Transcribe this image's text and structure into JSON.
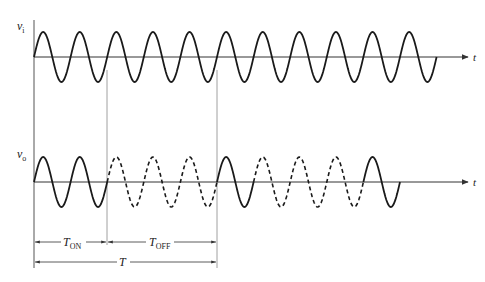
{
  "diagram": {
    "top_signal": {
      "label": "v",
      "subscript": "i",
      "axis_label": "t",
      "cycles_total": 11,
      "line_style": "solid"
    },
    "bottom_signal": {
      "label": "v",
      "subscript": "o",
      "axis_label": "t",
      "segments": [
        {
          "name": "on",
          "cycles": 2,
          "line_style": "solid"
        },
        {
          "name": "off",
          "cycles": 3,
          "line_style": "dashed"
        },
        {
          "name": "on",
          "cycles": 1,
          "line_style": "solid"
        },
        {
          "name": "off",
          "cycles": 3,
          "line_style": "dashed"
        },
        {
          "name": "on",
          "cycles": 1,
          "line_style": "solid"
        }
      ]
    },
    "intervals": {
      "t_on": {
        "label": "T",
        "subscript": "ON",
        "cycles": 2
      },
      "t_off": {
        "label": "T",
        "subscript": "OFF",
        "cycles": 3
      },
      "period": {
        "label": "T",
        "cycles": 5
      }
    },
    "colors": {
      "waveform": "#1a1a1a",
      "axis": "#333333",
      "guide_lines": "#888888"
    }
  }
}
